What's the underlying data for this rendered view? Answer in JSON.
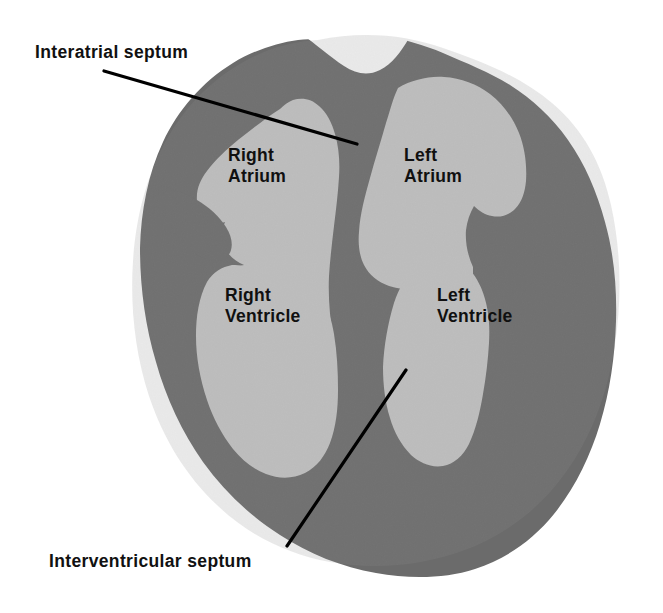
{
  "figure": {
    "background_color": "#ffffff",
    "myocardium_color": "#6b6b6b",
    "chamber_color": "#c9c9c9",
    "leader_line_color": "#000000",
    "text_color": "#111111"
  },
  "callouts": [
    {
      "id": "interatrial-septum",
      "label": "Interatrial septum",
      "leader_from": [
        104,
        71
      ],
      "leader_to": [
        357,
        144
      ]
    },
    {
      "id": "interventricular-septum",
      "label": "Interventricular septum",
      "leader_from": [
        287,
        546
      ],
      "leader_to": [
        406,
        370
      ]
    }
  ],
  "chambers": [
    {
      "id": "right-atrium",
      "line1": "Right",
      "line2": "Atrium"
    },
    {
      "id": "left-atrium",
      "line1": "Left",
      "line2": "Atrium"
    },
    {
      "id": "right-ventricle",
      "line1": "Right",
      "line2": "Ventricle"
    },
    {
      "id": "left-ventricle",
      "line1": "Left",
      "line2": "Ventricle"
    }
  ]
}
